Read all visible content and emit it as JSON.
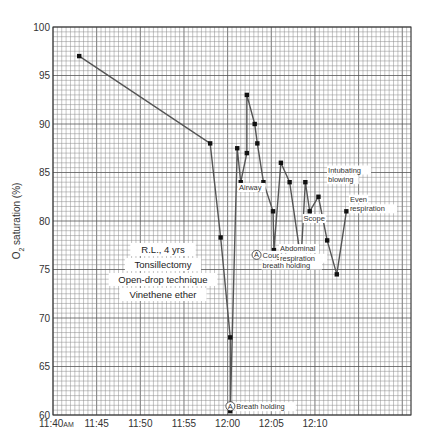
{
  "chart_data": {
    "type": "line",
    "title": "",
    "xlabel": "",
    "ylabel": "O2 saturation (%)",
    "ylabel_main": "O",
    "ylabel_sub": "2",
    "ylabel_rest": " saturation (%)",
    "grid": true,
    "x_unit": "minutes after 11:40 AM",
    "xlim": [
      0,
      41
    ],
    "ylim": [
      60,
      100
    ],
    "x_ticks": [
      {
        "value": 0,
        "label": "11:40",
        "suffix": "AM"
      },
      {
        "value": 5,
        "label": "11:45",
        "suffix": ""
      },
      {
        "value": 10,
        "label": "11:50",
        "suffix": ""
      },
      {
        "value": 15,
        "label": "11:55",
        "suffix": ""
      },
      {
        "value": 20,
        "label": "12:00",
        "suffix": ""
      },
      {
        "value": 25,
        "label": "12:05",
        "suffix": ""
      },
      {
        "value": 30,
        "label": "12:10",
        "suffix": ""
      }
    ],
    "y_ticks": [
      60,
      65,
      70,
      75,
      80,
      85,
      90,
      95,
      100
    ],
    "series": [
      {
        "name": "O2 saturation",
        "points": [
          {
            "x": 3,
            "y": 97
          },
          {
            "x": 18,
            "y": 88
          },
          {
            "x": 19.2,
            "y": 78.3
          },
          {
            "x": 20.3,
            "y": 68
          },
          {
            "x": 20.3,
            "y": 60.4
          },
          {
            "x": 21.1,
            "y": 87.5
          },
          {
            "x": 21.5,
            "y": 84
          },
          {
            "x": 22.2,
            "y": 87
          },
          {
            "x": 22.2,
            "y": 93
          },
          {
            "x": 23.1,
            "y": 90
          },
          {
            "x": 23.4,
            "y": 88
          },
          {
            "x": 24.1,
            "y": 84
          },
          {
            "x": 25.2,
            "y": 81
          },
          {
            "x": 25.3,
            "y": 77
          },
          {
            "x": 26.1,
            "y": 86
          },
          {
            "x": 27.1,
            "y": 84
          },
          {
            "x": 28.4,
            "y": 76
          },
          {
            "x": 28.9,
            "y": 84
          },
          {
            "x": 29.4,
            "y": 81
          },
          {
            "x": 30.4,
            "y": 82.5
          },
          {
            "x": 31.4,
            "y": 78
          },
          {
            "x": 32.5,
            "y": 74.5
          },
          {
            "x": 33.6,
            "y": 81
          }
        ]
      }
    ],
    "annotations": [
      {
        "text": "Airway",
        "x": 21.3,
        "y": 83.2
      },
      {
        "text": "Breath holding",
        "x": 21.0,
        "y": 60.6,
        "marker": "A"
      },
      {
        "text": "Coughing -",
        "x": 24.0,
        "y": 76.2,
        "marker": "A"
      },
      {
        "text": "breath holding",
        "x": 24.0,
        "y": 75.2
      },
      {
        "text": "Abdominal",
        "x": 26.0,
        "y": 76.9
      },
      {
        "text": "respiration",
        "x": 26.0,
        "y": 75.9
      },
      {
        "text": "Scope",
        "x": 28.7,
        "y": 80.0
      },
      {
        "text": "Intubating",
        "x": 31.5,
        "y": 85.0
      },
      {
        "text": "blowing",
        "x": 31.5,
        "y": 84.0
      },
      {
        "text": "Even",
        "x": 34.0,
        "y": 82.0
      },
      {
        "text": "respiration",
        "x": 34.0,
        "y": 81.0
      }
    ],
    "case_info": [
      "R.L., 4 yrs",
      "Tonsillectomy",
      "Open-drop technique",
      "Vinethene ether"
    ]
  }
}
